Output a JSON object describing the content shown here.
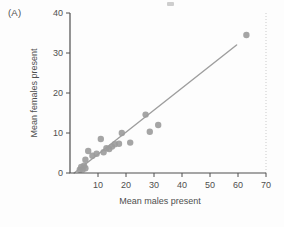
{
  "panel_label": "(A)",
  "colors": {
    "background": "#fdfdfd",
    "axis": "#4f4f4f",
    "text": "#4f4f4f",
    "point": "#9b9b9b",
    "fit_line": "#9e9e9e",
    "edge_rule": "#cbcbcb",
    "artifact": "#b9b9b9"
  },
  "chart_data": {
    "type": "scatter",
    "title": "",
    "xlabel": "Mean males present",
    "ylabel": "Mean females present",
    "xlim": [
      0,
      70
    ],
    "ylim": [
      0,
      40
    ],
    "xticks": [
      10,
      20,
      30,
      40,
      50,
      60,
      70
    ],
    "yticks": [
      0,
      10,
      20,
      30,
      40
    ],
    "grid": false,
    "legend": false,
    "points": [
      [
        3.5,
        0.8
      ],
      [
        4,
        1.5
      ],
      [
        4.5,
        0.9
      ],
      [
        5,
        1.8
      ],
      [
        5.5,
        1.2
      ],
      [
        5.5,
        3.3
      ],
      [
        6.5,
        5.5
      ],
      [
        8,
        4.3
      ],
      [
        9.5,
        4.8
      ],
      [
        11,
        8.5
      ],
      [
        12,
        5.2
      ],
      [
        13,
        6.2
      ],
      [
        14,
        6.0
      ],
      [
        15,
        6.6
      ],
      [
        16,
        7.2
      ],
      [
        17.5,
        7.3
      ],
      [
        18.5,
        10.0
      ],
      [
        21.5,
        7.6
      ],
      [
        27,
        14.6
      ],
      [
        28.5,
        10.3
      ],
      [
        31.5,
        12.0
      ],
      [
        63,
        34.5
      ]
    ],
    "fit_line": {
      "x1": 1.5,
      "y1": 0,
      "x2": 59.5,
      "y2": 32
    },
    "right_edge_rule_x": 70
  }
}
